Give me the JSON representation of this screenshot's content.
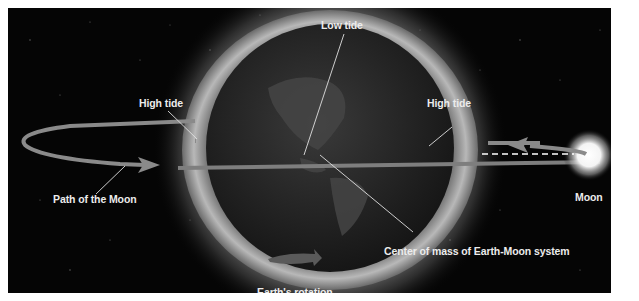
{
  "diagram": {
    "labels": {
      "low_tide": "Low tide",
      "high_tide_left": "High tide",
      "high_tide_right": "High tide",
      "path_of_moon": "Path of the Moon",
      "moon": "Moon",
      "center_of_mass": "Center of mass of Earth-Moon system",
      "earths_rotation": "Earth's rotation"
    },
    "colors": {
      "background": "#050505",
      "frame": "#ffffff",
      "orbit_path": "#8a8a8a",
      "label_text": "#ececec",
      "earth": "#2a2a2a",
      "tidal_bulge": "#9a9a9a",
      "moon_glow": "#ffffff"
    }
  }
}
